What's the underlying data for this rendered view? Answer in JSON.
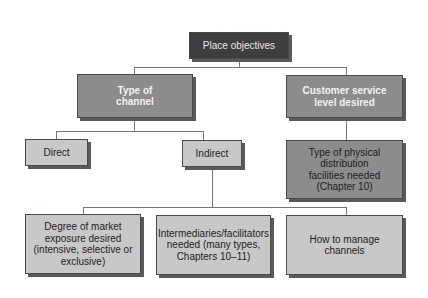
{
  "diagram": {
    "root": {
      "label": "Place objectives"
    },
    "level1": [
      {
        "label": "Type of\nchannel"
      },
      {
        "label": "Customer service\nlevel desired"
      }
    ],
    "level2": [
      {
        "label": "Direct"
      },
      {
        "label": "Indirect"
      },
      {
        "label": "Type of physical\ndistribution\nfacilities needed\n(Chapter 10)"
      }
    ],
    "level3": [
      {
        "label": "Degree of market\nexposure desired\n(intensive, selective or\nexclusive)"
      },
      {
        "label": "Intermediaries/facilitators\nneeded (many types,\nChapters 10–11)"
      },
      {
        "label": "How to manage\nchannels"
      }
    ],
    "colors": {
      "root_fill": "#3e3e3e",
      "level1_fill": "#8c8c8c",
      "leaf_fill": "#c8c8c8",
      "shadow": "#5a5a5a",
      "connector": "#777777"
    }
  }
}
